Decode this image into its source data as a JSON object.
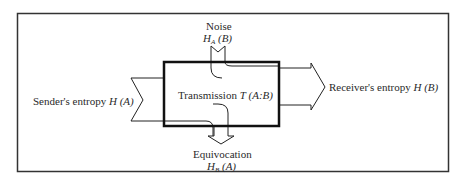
{
  "diagram": {
    "type": "information-flow",
    "colors": {
      "line": "#222222",
      "frame": "#333333",
      "background": "#ffffff"
    },
    "noise": {
      "title": "Noise",
      "symbol": "H",
      "subscript": "A",
      "arg": "(B)"
    },
    "transmission": {
      "title": "Transmission",
      "symbol": "T",
      "arg": "(A:B)"
    },
    "sender": {
      "title": "Sender's entropy",
      "symbol": "H",
      "arg": "(A)"
    },
    "receiver": {
      "title": "Receiver's entropy",
      "symbol": "H",
      "arg": "(B)"
    },
    "equivocation": {
      "title": "Equivocation",
      "symbol": "H",
      "subscript": "B",
      "arg": "(A)"
    }
  }
}
